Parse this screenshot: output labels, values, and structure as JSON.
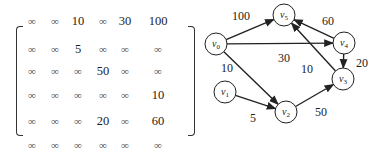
{
  "matrix": {
    "size": 6,
    "rows": [
      [
        "∞",
        "∞",
        "10",
        "∞",
        "30",
        "100"
      ],
      [
        "∞",
        "∞",
        "5",
        "∞",
        "∞",
        "∞"
      ],
      [
        "∞",
        "∞",
        "∞",
        "50",
        "∞",
        "∞"
      ],
      [
        "∞",
        "∞",
        "∞",
        "∞",
        "∞",
        "10"
      ],
      [
        "∞",
        "∞",
        "∞",
        "20",
        "∞",
        "60"
      ],
      [
        "∞",
        "∞",
        "∞",
        "∞",
        "∞",
        "∞"
      ]
    ]
  },
  "graph": {
    "nodes": [
      {
        "id": "v0",
        "label": "v",
        "sub": "0",
        "x": 216,
        "y": 44
      },
      {
        "id": "v1",
        "label": "v",
        "sub": "1",
        "x": 225,
        "y": 92
      },
      {
        "id": "v2",
        "label": "v",
        "sub": "2",
        "x": 286,
        "y": 112
      },
      {
        "id": "v3",
        "label": "v",
        "sub": "3",
        "x": 343,
        "y": 79
      },
      {
        "id": "v4",
        "label": "v",
        "sub": "4",
        "x": 344,
        "y": 43
      },
      {
        "id": "v5",
        "label": "v",
        "sub": "5",
        "x": 284,
        "y": 15
      }
    ],
    "edges": [
      {
        "from": "v0",
        "to": "v5",
        "weight": "100",
        "lx": 232,
        "ly": 20
      },
      {
        "from": "v0",
        "to": "v4",
        "weight": "30",
        "lx": 278,
        "ly": 62
      },
      {
        "from": "v0",
        "to": "v2",
        "weight": "10",
        "lx": 221,
        "ly": 72
      },
      {
        "from": "v1",
        "to": "v2",
        "weight": "5",
        "lx": 250,
        "ly": 122
      },
      {
        "from": "v2",
        "to": "v3",
        "weight": "50",
        "lx": 315,
        "ly": 116
      },
      {
        "from": "v3",
        "to": "v5",
        "weight": "10",
        "lx": 301,
        "ly": 73
      },
      {
        "from": "v4",
        "to": "v5",
        "weight": "60",
        "lx": 322,
        "ly": 25
      },
      {
        "from": "v4",
        "to": "v3",
        "weight": "20",
        "lx": 356,
        "ly": 67
      }
    ],
    "node_radius": 11,
    "stroke_color": "#222222"
  }
}
